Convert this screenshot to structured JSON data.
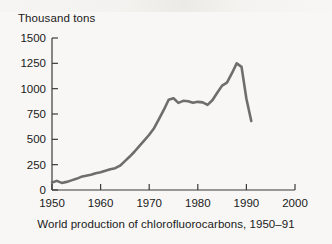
{
  "figure": {
    "caption": "World production of chlorofluorocarbons, 1950–91",
    "y_axis_label": "Thousand tons",
    "line_color": "#6e6e6e",
    "axis_color": "#3a3a3a",
    "background_color": "#f8f7f5"
  },
  "chart_data": {
    "type": "line",
    "title": "",
    "subtitle": "",
    "caption": "World production of chlorofluorocarbons, 1950–91",
    "xlabel": "",
    "ylabel": "Thousand tons",
    "xlim": [
      1950,
      2000
    ],
    "ylim": [
      0,
      1500
    ],
    "xticks": [
      1950,
      1960,
      1970,
      1980,
      1990,
      2000
    ],
    "yticks": [
      0,
      250,
      500,
      750,
      1000,
      1250,
      1500
    ],
    "xtick_labels": [
      "1950",
      "1960",
      "1970",
      "1980",
      "1990",
      "2000"
    ],
    "ytick_labels": [
      "0",
      "250",
      "500",
      "750",
      "1000",
      "1250",
      "1500"
    ],
    "grid": false,
    "legend": null,
    "legend_position": "none",
    "annotations": [],
    "series": [
      {
        "name": "World CFC production",
        "units": "thousand tons",
        "x": [
          1950,
          1951,
          1952,
          1953,
          1954,
          1955,
          1956,
          1957,
          1958,
          1959,
          1960,
          1961,
          1962,
          1963,
          1964,
          1965,
          1966,
          1967,
          1968,
          1969,
          1970,
          1971,
          1972,
          1973,
          1974,
          1975,
          1976,
          1977,
          1978,
          1979,
          1980,
          1981,
          1982,
          1983,
          1984,
          1985,
          1986,
          1987,
          1988,
          1989,
          1990,
          1991
        ],
        "values": [
          75,
          90,
          70,
          80,
          95,
          110,
          130,
          140,
          150,
          165,
          175,
          190,
          205,
          215,
          240,
          285,
          330,
          380,
          435,
          490,
          545,
          610,
          700,
          790,
          890,
          905,
          860,
          880,
          875,
          860,
          870,
          865,
          840,
          885,
          960,
          1030,
          1060,
          1150,
          1250,
          1215,
          900,
          680
        ]
      }
    ]
  }
}
